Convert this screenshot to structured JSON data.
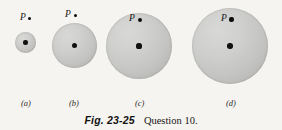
{
  "figure": {
    "caption_figure_number": "Fig. 23-25",
    "caption_text": "Question 10.",
    "background_color": "#f6f4f0",
    "sphere_fill_color": "#c4c4c2",
    "dot_color": "#111111",
    "panels": [
      {
        "id": "a",
        "panel_label": "(a)",
        "point_label": "P",
        "sphere": {
          "cx": 25.5,
          "cy": 42.5,
          "diameter": 21
        },
        "center_dot_diameter": 4.4,
        "point_p": {
          "x": 29.5,
          "y": 18.5,
          "dot_diameter": 3.6
        },
        "p_label_pos": {
          "x": 20,
          "y": 13
        },
        "panel_label_pos": {
          "x": 21,
          "y": 99
        }
      },
      {
        "id": "b",
        "panel_label": "(b)",
        "point_label": "P",
        "sphere": {
          "cx": 74.5,
          "cy": 45.5,
          "diameter": 45
        },
        "center_dot_diameter": 5.0,
        "point_p": {
          "x": 75.5,
          "y": 15.5,
          "dot_diameter": 3.8
        },
        "p_label_pos": {
          "x": 65,
          "y": 10
        },
        "panel_label_pos": {
          "x": 69,
          "y": 99
        }
      },
      {
        "id": "c",
        "panel_label": "(c)",
        "point_label": "P",
        "sphere": {
          "cx": 139,
          "cy": 46,
          "diameter": 66
        },
        "center_dot_diameter": 5.2,
        "point_p": {
          "x": 139.5,
          "y": 19.5,
          "dot_diameter": 4.0
        },
        "p_label_pos": {
          "x": 129,
          "y": 14
        },
        "panel_label_pos": {
          "x": 135,
          "y": 99
        }
      },
      {
        "id": "d",
        "panel_label": "(d)",
        "point_label": "P",
        "sphere": {
          "cx": 230,
          "cy": 46,
          "diameter": 76
        },
        "center_dot_diameter": 5.4,
        "point_p": {
          "x": 231.5,
          "y": 19.5,
          "dot_diameter": 4.2
        },
        "p_label_pos": {
          "x": 221,
          "y": 14
        },
        "panel_label_pos": {
          "x": 226,
          "y": 99
        }
      }
    ]
  }
}
